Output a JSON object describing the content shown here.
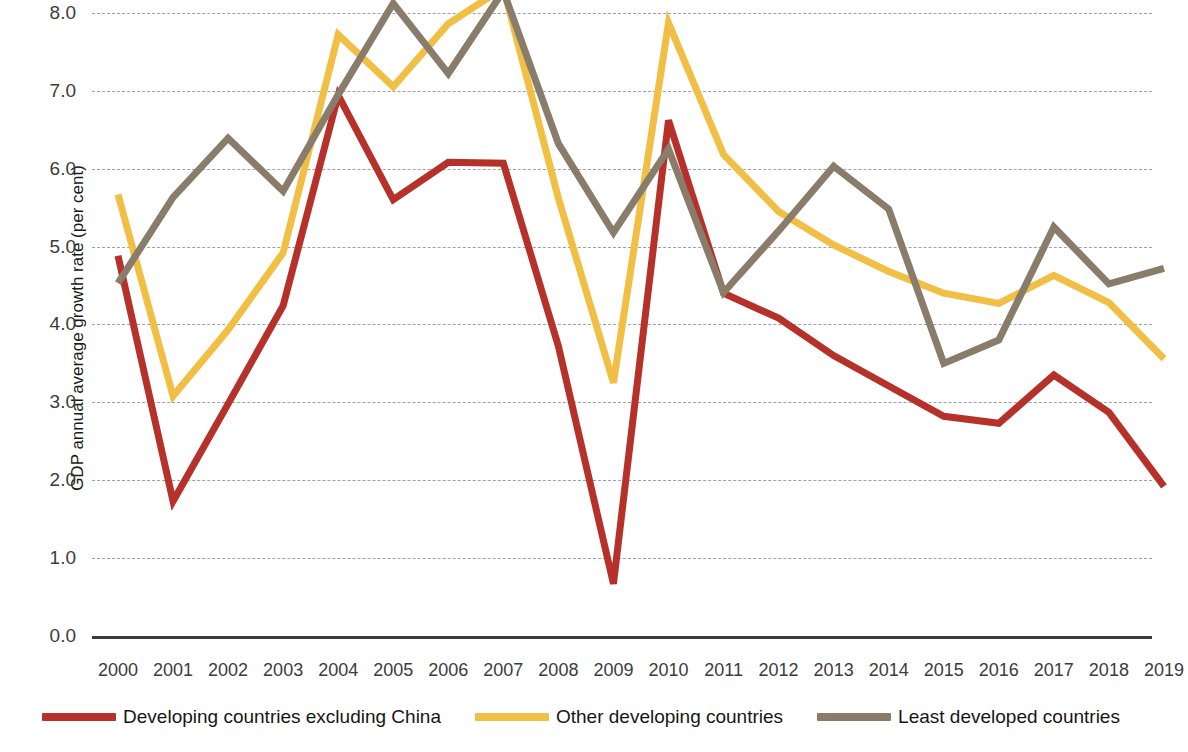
{
  "chart_data": {
    "type": "line",
    "title": "",
    "xlabel": "",
    "ylabel": "GDP annual average growth rate (per cent)",
    "grid": true,
    "legend_position": "bottom",
    "ylim": [
      0.0,
      8.3
    ],
    "yticks": [
      "0.0",
      "1.0",
      "2.0",
      "3.0",
      "4.0",
      "5.0",
      "6.0",
      "7.0",
      "8.0"
    ],
    "ytick_values": [
      0.0,
      1.0,
      2.0,
      3.0,
      4.0,
      5.0,
      6.0,
      7.0,
      8.0
    ],
    "categories": [
      "2000",
      "2001",
      "2002",
      "2003",
      "2004",
      "2005",
      "2006",
      "2007",
      "2008",
      "2009",
      "2010",
      "2011",
      "2012",
      "2013",
      "2014",
      "2015",
      "2016",
      "2017",
      "2018",
      "2019"
    ],
    "series": [
      {
        "name": "Developing countries excluding China",
        "color": "#b5312a",
        "values": [
          4.88,
          1.73,
          2.98,
          4.24,
          6.94,
          5.6,
          6.08,
          6.07,
          3.72,
          0.67,
          6.62,
          4.4,
          4.08,
          3.6,
          3.21,
          2.82,
          2.73,
          3.35,
          2.87,
          1.92
        ]
      },
      {
        "name": "Other developing countries",
        "color": "#f0bf44",
        "values": [
          5.67,
          3.08,
          3.93,
          4.92,
          7.72,
          7.05,
          7.86,
          8.32,
          5.62,
          3.25,
          7.87,
          6.18,
          5.45,
          5.02,
          4.68,
          4.4,
          4.27,
          4.63,
          4.28,
          3.56
        ]
      },
      {
        "name": "Least developed countries",
        "color": "#8a7c6b",
        "values": [
          4.53,
          5.63,
          6.39,
          5.71,
          6.95,
          8.12,
          7.22,
          8.28,
          6.32,
          5.18,
          6.25,
          4.41,
          5.2,
          6.03,
          5.48,
          3.5,
          3.8,
          5.25,
          4.52,
          4.72
        ]
      }
    ]
  },
  "legend": {
    "items": [
      {
        "label": "Developing countries excluding China"
      },
      {
        "label": "Other developing countries"
      },
      {
        "label": "Least developed countries"
      }
    ]
  }
}
